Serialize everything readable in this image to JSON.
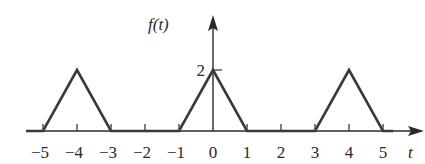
{
  "chart_data": {
    "type": "line",
    "title": "",
    "xlabel": "t",
    "ylabel": "f(t)",
    "x_ticks": [
      -5,
      -4,
      -3,
      -2,
      -1,
      0,
      1,
      2,
      3,
      4,
      5
    ],
    "x_tick_labels": [
      "−5",
      "−4",
      "−3",
      "−2",
      "−1",
      "0",
      "1",
      "2",
      "3",
      "4",
      "5"
    ],
    "y_ticks": [
      2
    ],
    "y_tick_labels": [
      "2"
    ],
    "xlim": [
      -5.5,
      6.1
    ],
    "ylim": [
      0,
      3.4
    ],
    "grid": false,
    "legend": null,
    "series": [
      {
        "name": "f(t)",
        "x": [
          -5.5,
          -5,
          -4,
          -3,
          -1,
          0,
          1,
          3,
          4,
          5,
          5.3
        ],
        "y": [
          0,
          0,
          2,
          0,
          0,
          2,
          0,
          0,
          2,
          0,
          0
        ]
      }
    ]
  },
  "colors": {
    "line": "#3a3a3a",
    "axis": "#2a2a2a",
    "background": "#ffffff"
  }
}
